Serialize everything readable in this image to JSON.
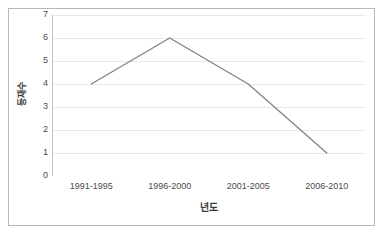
{
  "chart_data": {
    "type": "line",
    "title": "",
    "subtitle": "",
    "xlabel": "년도",
    "ylabel": "등재수",
    "categories": [
      "1991-1995",
      "1996-2000",
      "2001-2005",
      "2006-2010"
    ],
    "values": [
      4,
      6,
      4,
      1
    ],
    "series": [
      {
        "name": "등재수",
        "values": [
          4,
          6,
          4,
          1
        ]
      }
    ],
    "ylim": [
      0,
      7
    ],
    "y_ticks": [
      0,
      1,
      2,
      3,
      4,
      5,
      6,
      7
    ],
    "y_tick_labels": [
      "0",
      "1",
      "2",
      "3",
      "4",
      "5",
      "6",
      "7"
    ],
    "grid": "horizontal",
    "legend": "none",
    "markers": "none",
    "colors": {
      "line": "#808285",
      "gridline": "#e8e8e8",
      "axis": "#c0c0c0",
      "border": "#b8b8b8",
      "background": "#ffffff",
      "tick_text": "#4a4a4a",
      "title_text": "#3a3a3a"
    }
  }
}
